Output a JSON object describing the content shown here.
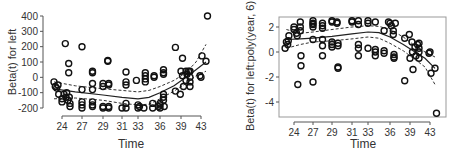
{
  "chart_data": [
    {
      "type": "scatter",
      "title": "",
      "xlabel": "Time",
      "ylabel": "Beta(t) for left",
      "xticks": [
        24,
        27,
        29,
        31,
        33,
        36,
        39,
        43
      ],
      "yticks": [
        -200,
        -100,
        0,
        100,
        200,
        300,
        400
      ],
      "xlim": [
        22,
        44.5
      ],
      "ylim": [
        -200,
        400
      ],
      "frame": "open-axes",
      "grid": false,
      "legend": null,
      "points": [
        [
          22.8,
          -30
        ],
        [
          23.0,
          -60
        ],
        [
          23.2,
          -70
        ],
        [
          23.4,
          -50
        ],
        [
          23.5,
          -110
        ],
        [
          24.0,
          -140
        ],
        [
          24.0,
          -160
        ],
        [
          24.3,
          -110
        ],
        [
          24.5,
          220
        ],
        [
          24.6,
          -130
        ],
        [
          24.7,
          -100
        ],
        [
          24.9,
          -150
        ],
        [
          25.0,
          90
        ],
        [
          25.0,
          30
        ],
        [
          25.1,
          -130
        ],
        [
          25.2,
          -170
        ],
        [
          25.2,
          -190
        ],
        [
          27.0,
          200
        ],
        [
          27.0,
          -80
        ],
        [
          27.0,
          -160
        ],
        [
          27.0,
          -180
        ],
        [
          27.0,
          -200
        ],
        [
          28.0,
          30
        ],
        [
          28.0,
          40
        ],
        [
          28.0,
          -40
        ],
        [
          28.0,
          -80
        ],
        [
          28.0,
          -160
        ],
        [
          28.0,
          -180
        ],
        [
          28.0,
          -190
        ],
        [
          29.0,
          -40
        ],
        [
          29.0,
          -60
        ],
        [
          29.0,
          -190
        ],
        [
          29.0,
          -200
        ],
        [
          29.5,
          110
        ],
        [
          29.5,
          105
        ],
        [
          29.6,
          -40
        ],
        [
          29.6,
          -50
        ],
        [
          29.6,
          -190
        ],
        [
          29.6,
          -200
        ],
        [
          31.0,
          -200
        ],
        [
          31.5,
          35
        ],
        [
          31.5,
          -30
        ],
        [
          31.5,
          -50
        ],
        [
          31.5,
          -170
        ],
        [
          31.5,
          -200
        ],
        [
          32.8,
          -20
        ],
        [
          33.0,
          -180
        ],
        [
          33.0,
          -200
        ],
        [
          33.2,
          -190
        ],
        [
          33.8,
          -200
        ],
        [
          34.0,
          30
        ],
        [
          34.0,
          10
        ],
        [
          34.0,
          -10
        ],
        [
          34.0,
          -30
        ],
        [
          35.0,
          -170
        ],
        [
          35.0,
          -200
        ],
        [
          35.2,
          0
        ],
        [
          35.2,
          10
        ],
        [
          35.8,
          -190
        ],
        [
          36.0,
          -170
        ],
        [
          36.0,
          -180
        ],
        [
          36.0,
          -200
        ],
        [
          36.5,
          50
        ],
        [
          36.5,
          30
        ],
        [
          36.5,
          20
        ],
        [
          36.5,
          -110
        ],
        [
          36.5,
          -130
        ],
        [
          36.5,
          -150
        ],
        [
          36.6,
          -190
        ],
        [
          38.2,
          195
        ],
        [
          38.2,
          -90
        ],
        [
          38.9,
          -110
        ],
        [
          39.0,
          40
        ],
        [
          39.3,
          125
        ],
        [
          39.3,
          10
        ],
        [
          39.5,
          -60
        ],
        [
          40.0,
          40
        ],
        [
          40.0,
          -20
        ],
        [
          40.2,
          20
        ],
        [
          40.5,
          40
        ],
        [
          40.8,
          40
        ],
        [
          40.8,
          0
        ],
        [
          40.8,
          -30
        ],
        [
          40.8,
          -60
        ],
        [
          42.8,
          10
        ],
        [
          43.0,
          0
        ],
        [
          43.2,
          140
        ],
        [
          44.0,
          105
        ],
        [
          44.3,
          400
        ]
      ],
      "fit_line": [
        [
          22.8,
          -75
        ],
        [
          26,
          -95
        ],
        [
          29,
          -115
        ],
        [
          31,
          -130
        ],
        [
          33,
          -140
        ],
        [
          34.5,
          -130
        ],
        [
          36,
          -100
        ],
        [
          38,
          -55
        ],
        [
          40,
          0
        ],
        [
          42,
          50
        ],
        [
          44,
          100
        ]
      ],
      "ci_upper": [
        [
          22.8,
          -30
        ],
        [
          26,
          -55
        ],
        [
          29,
          -75
        ],
        [
          31,
          -85
        ],
        [
          33,
          -95
        ],
        [
          34.5,
          -85
        ],
        [
          36,
          -60
        ],
        [
          38,
          -20
        ],
        [
          40,
          30
        ],
        [
          42,
          100
        ],
        [
          44,
          215
        ]
      ],
      "ci_lower": [
        [
          22.8,
          -140
        ],
        [
          26,
          -135
        ],
        [
          29,
          -150
        ],
        [
          31,
          -170
        ],
        [
          33,
          -180
        ],
        [
          34.5,
          -175
        ],
        [
          36,
          -140
        ],
        [
          38,
          -90
        ],
        [
          40,
          -40
        ],
        [
          42,
          10
        ],
        [
          44,
          40
        ]
      ]
    },
    {
      "type": "scatter",
      "title": "",
      "xlabel": "Time",
      "ylabel": "Beta(t) for left:poly(year, 6)",
      "xticks": [
        24,
        27,
        29,
        31,
        33,
        36,
        39,
        43
      ],
      "yticks": [
        -4,
        -2,
        0,
        2
      ],
      "xlim": [
        22,
        44.5
      ],
      "ylim": [
        -5.2,
        2.8
      ],
      "frame": "box",
      "grid": false,
      "legend": null,
      "points": [
        [
          22.6,
          0.3
        ],
        [
          22.8,
          0.8
        ],
        [
          23.0,
          0.6
        ],
        [
          23.1,
          0.9
        ],
        [
          23.2,
          1.3
        ],
        [
          24.0,
          2.0
        ],
        [
          24.0,
          1.8
        ],
        [
          24.4,
          1.5
        ],
        [
          24.5,
          1.3
        ],
        [
          24.6,
          -2.6
        ],
        [
          25.0,
          2.4
        ],
        [
          25.0,
          2.0
        ],
        [
          25.0,
          1.7
        ],
        [
          25.1,
          -0.3
        ],
        [
          25.1,
          -1.1
        ],
        [
          27.0,
          2.5
        ],
        [
          27.0,
          2.3
        ],
        [
          27.0,
          2.2
        ],
        [
          27.0,
          2.0
        ],
        [
          27.0,
          1.0
        ],
        [
          27.0,
          -2.4
        ],
        [
          28.0,
          2.3
        ],
        [
          28.0,
          2.1
        ],
        [
          28.0,
          1.9
        ],
        [
          28.0,
          1.0
        ],
        [
          28.0,
          0.5
        ],
        [
          28.0,
          -0.3
        ],
        [
          29.0,
          2.4
        ],
        [
          29.0,
          2.5
        ],
        [
          29.0,
          0.8
        ],
        [
          29.0,
          0.6
        ],
        [
          29.0,
          0.4
        ],
        [
          29.5,
          2.4
        ],
        [
          29.5,
          2.3
        ],
        [
          29.6,
          0.7
        ],
        [
          29.6,
          0.5
        ],
        [
          29.6,
          -1.2
        ],
        [
          29.6,
          -1.3
        ],
        [
          31.0,
          2.5
        ],
        [
          31.0,
          2.4
        ],
        [
          31.8,
          2.5
        ],
        [
          31.8,
          2.2
        ],
        [
          31.8,
          0.6
        ],
        [
          31.8,
          0.3
        ],
        [
          31.8,
          -0.3
        ],
        [
          33.0,
          2.5
        ],
        [
          33.0,
          2.3
        ],
        [
          33.0,
          0.3
        ],
        [
          34.0,
          2.4
        ],
        [
          34.0,
          0.2
        ],
        [
          34.0,
          0.0
        ],
        [
          34.0,
          -0.3
        ],
        [
          35.2,
          1.7
        ],
        [
          35.2,
          0.1
        ],
        [
          35.2,
          -0.1
        ],
        [
          35.8,
          2.4
        ],
        [
          36.0,
          2.3
        ],
        [
          36.2,
          2.1
        ],
        [
          36.5,
          1.7
        ],
        [
          36.5,
          1.4
        ],
        [
          36.6,
          -0.2
        ],
        [
          36.6,
          -0.4
        ],
        [
          36.6,
          -0.5
        ],
        [
          36.8,
          2.3
        ],
        [
          38.2,
          1.1
        ],
        [
          38.2,
          -2.3
        ],
        [
          38.9,
          1.4
        ],
        [
          39.0,
          -0.5
        ],
        [
          39.4,
          0.8
        ],
        [
          39.5,
          0.0
        ],
        [
          39.6,
          -1.4
        ],
        [
          40.0,
          0.4
        ],
        [
          40.2,
          -0.3
        ],
        [
          40.5,
          0.6
        ],
        [
          40.8,
          0.7
        ],
        [
          40.8,
          0.3
        ],
        [
          40.8,
          0.0
        ],
        [
          40.8,
          -0.5
        ],
        [
          42.8,
          -0.1
        ],
        [
          43.0,
          0.0
        ],
        [
          43.2,
          -1.7
        ],
        [
          44.0,
          -1.3
        ],
        [
          44.3,
          -4.9
        ]
      ],
      "fit_line": [
        [
          22.8,
          1.0
        ],
        [
          25,
          1.05
        ],
        [
          27,
          1.1
        ],
        [
          29,
          1.25
        ],
        [
          31,
          1.45
        ],
        [
          33,
          1.6
        ],
        [
          34.5,
          1.55
        ],
        [
          36,
          1.2
        ],
        [
          38,
          0.6
        ],
        [
          40,
          0.0
        ],
        [
          42,
          -0.5
        ],
        [
          44,
          -1.3
        ]
      ],
      "ci_upper": [
        [
          22.8,
          1.8
        ],
        [
          25,
          1.5
        ],
        [
          27,
          1.6
        ],
        [
          29,
          1.8
        ],
        [
          31,
          2.0
        ],
        [
          33,
          2.1
        ],
        [
          34.5,
          2.05
        ],
        [
          36,
          1.8
        ],
        [
          38,
          1.2
        ],
        [
          40,
          0.5
        ],
        [
          42,
          0.0
        ],
        [
          44,
          -0.4
        ]
      ],
      "ci_lower": [
        [
          22.8,
          0.3
        ],
        [
          25,
          0.6
        ],
        [
          27,
          0.8
        ],
        [
          29,
          0.9
        ],
        [
          31,
          1.05
        ],
        [
          33,
          1.2
        ],
        [
          34.5,
          1.1
        ],
        [
          36,
          0.7
        ],
        [
          38,
          0.1
        ],
        [
          40,
          -0.6
        ],
        [
          42,
          -1.2
        ],
        [
          44,
          -2.6
        ]
      ]
    }
  ],
  "labels": {
    "left": {
      "xlabel": "Time",
      "ylabel": "Beta(t) for left"
    },
    "right": {
      "xlabel": "Time",
      "ylabel": "Beta(t) for left:poly(year, 6)"
    }
  }
}
